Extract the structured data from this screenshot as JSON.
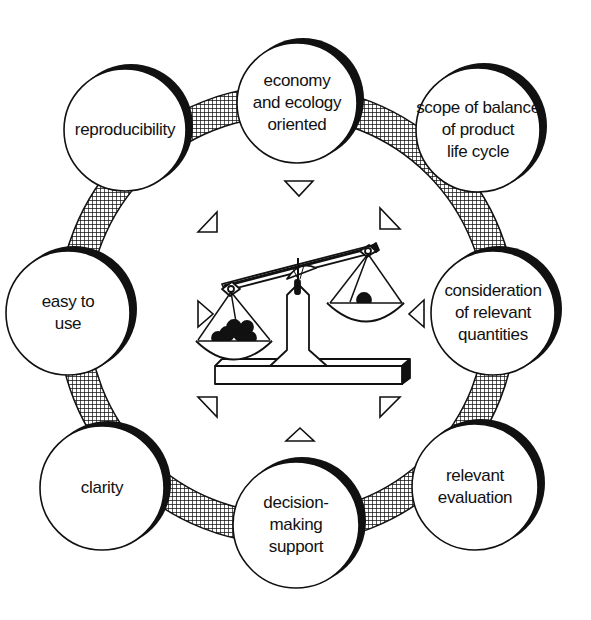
{
  "diagram": {
    "center_icon": "balance-scale-icon",
    "ring_pattern": "crosshatch",
    "colors": {
      "stroke": "#111111",
      "fill": "#ffffff",
      "hatch": "#111111"
    },
    "nodes": [
      {
        "id": "reproducibility",
        "label": "reproducibility",
        "cx": 125,
        "cy": 130,
        "r": 61
      },
      {
        "id": "economy-ecology",
        "label": "economy\nand ecology\noriented",
        "cx": 297,
        "cy": 103,
        "r": 60
      },
      {
        "id": "scope-balance",
        "label": "scope of balance\nof product\nlife cycle",
        "cx": 478,
        "cy": 130,
        "r": 62
      },
      {
        "id": "easy-to-use",
        "label": "easy to\nuse",
        "cx": 68,
        "cy": 313,
        "r": 62
      },
      {
        "id": "consideration",
        "label": "consideration\nof relevant\nquantities",
        "cx": 493,
        "cy": 313,
        "r": 62
      },
      {
        "id": "clarity",
        "label": "clarity",
        "cx": 102,
        "cy": 488,
        "r": 62
      },
      {
        "id": "decision-making",
        "label": "decision-\nmaking\nsupport",
        "cx": 296,
        "cy": 525,
        "r": 63
      },
      {
        "id": "relevant-evaluation",
        "label": "relevant\nevaluation",
        "cx": 475,
        "cy": 487,
        "r": 63
      }
    ]
  }
}
